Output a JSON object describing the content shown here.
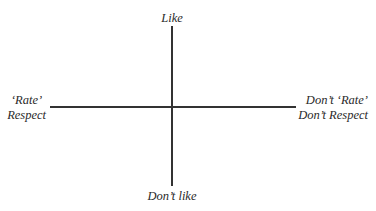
{
  "diagram": {
    "type": "quadrant-axes",
    "axes": {
      "vertical": {
        "top_label": "Like",
        "bottom_label": "Don’t like"
      },
      "horizontal": {
        "left_label_lines": [
          "‘Rate’",
          "Respect"
        ],
        "right_label_lines": [
          "Don’t ‘Rate’",
          "Don’t Respect"
        ]
      }
    },
    "line_color": "#333333",
    "text_color": "#2a2a2a",
    "background": "#ffffff"
  }
}
